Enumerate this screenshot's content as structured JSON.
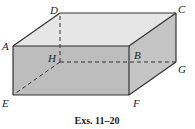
{
  "figure": {
    "caption": "Exs. 11–20",
    "shape": "rectangular-box",
    "colors": {
      "top_face": "#e6e6e6",
      "front_face": "#bdbdbd",
      "right_face": "#c5c5c5",
      "edge": "#333333"
    },
    "vertices": {
      "A": {
        "label": "A",
        "x": 13,
        "y": 46
      },
      "B": {
        "label": "B",
        "x": 129,
        "y": 46
      },
      "C": {
        "label": "C",
        "x": 176,
        "y": 13
      },
      "D": {
        "label": "D",
        "x": 60,
        "y": 13
      },
      "E": {
        "label": "E",
        "x": 13,
        "y": 95
      },
      "F": {
        "label": "F",
        "x": 129,
        "y": 95
      },
      "G": {
        "label": "G",
        "x": 176,
        "y": 62
      },
      "H": {
        "label": "H",
        "x": 60,
        "y": 62
      }
    },
    "hidden_edges": [
      "HD",
      "HE",
      "HG"
    ],
    "visible_edges": [
      "AB",
      "BC",
      "CD",
      "DA",
      "AE",
      "BF",
      "CG",
      "EF",
      "FG"
    ]
  }
}
